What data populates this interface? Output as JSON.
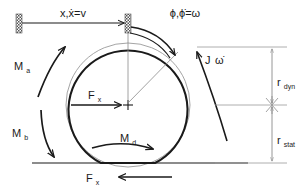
{
  "diagram": {
    "labels": {
      "translation": "x,ẋ=v",
      "rotation": "ϕ,ϕ̇=ω",
      "inertia_torque_main": "J",
      "inertia_torque_sub": "ω̇",
      "moment_a_main": "M",
      "moment_a_sub": "a",
      "moment_b_main": "M",
      "moment_b_sub": "b",
      "moment_d_main": "M",
      "moment_d_sub": "d",
      "force_center_main": "F",
      "force_center_sub": "x",
      "force_ground_main": "F",
      "force_ground_sub": "x",
      "radius_dyn_main": "r",
      "radius_dyn_sub": "dyn",
      "radius_stat_main": "r",
      "radius_stat_sub": "stat"
    },
    "colors": {
      "stroke": "#1a1a1a",
      "thin": "#808080",
      "background": "#ffffff"
    },
    "geometry": {
      "wheel_center_x": 128,
      "wheel_center_y": 105,
      "wheel_radius": 62,
      "ground_y": 163,
      "dimension_line_x": 272
    }
  }
}
